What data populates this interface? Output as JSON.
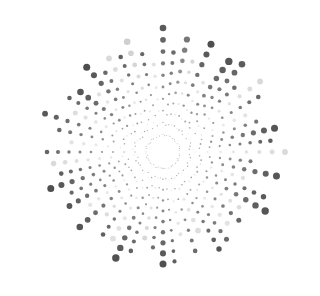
{
  "artwork": {
    "type": "radial-dot-starburst",
    "background": "#ffffff",
    "center": [
      163,
      152
    ],
    "width": 320,
    "height": 296,
    "rays": [
      {
        "angle": -90,
        "length": 124,
        "shade": "#5a5a5a",
        "dots": 10,
        "maxR": 2.8
      },
      {
        "angle": -84,
        "length": 100,
        "shade": "#6a6a6a",
        "dots": 9,
        "maxR": 1.8
      },
      {
        "angle": -78,
        "length": 115,
        "shade": "#777777",
        "dots": 10,
        "maxR": 2.6
      },
      {
        "angle": -72,
        "length": 95,
        "shade": "#d6d6d6",
        "dots": 8,
        "maxR": 1.6
      },
      {
        "angle": -66,
        "length": 118,
        "shade": "#4e4e4e",
        "dots": 10,
        "maxR": 3.0
      },
      {
        "angle": -60,
        "length": 80,
        "shade": "#e2e2e2",
        "dots": 7,
        "maxR": 1.4
      },
      {
        "angle": -54,
        "length": 112,
        "shade": "#555555",
        "dots": 10,
        "maxR": 3.2
      },
      {
        "angle": -48,
        "length": 118,
        "shade": "#5c5c5c",
        "dots": 10,
        "maxR": 2.8
      },
      {
        "angle": -42,
        "length": 96,
        "shade": "#6e6e6e",
        "dots": 9,
        "maxR": 1.8
      },
      {
        "angle": -36,
        "length": 120,
        "shade": "#d8d8d8",
        "dots": 9,
        "maxR": 2.4
      },
      {
        "angle": -30,
        "length": 110,
        "shade": "#676767",
        "dots": 10,
        "maxR": 1.8
      },
      {
        "angle": -24,
        "length": 90,
        "shade": "#e4e4e4",
        "dots": 7,
        "maxR": 1.6
      },
      {
        "angle": -18,
        "length": 98,
        "shade": "#777777",
        "dots": 8,
        "maxR": 1.6
      },
      {
        "angle": -12,
        "length": 114,
        "shade": "#555555",
        "dots": 10,
        "maxR": 3.0
      },
      {
        "angle": -6,
        "length": 108,
        "shade": "#5e5e5e",
        "dots": 10,
        "maxR": 1.8
      },
      {
        "angle": 0,
        "length": 122,
        "shade": "#dadada",
        "dots": 9,
        "maxR": 2.4
      },
      {
        "angle": 6,
        "length": 88,
        "shade": "#7a7a7a",
        "dots": 8,
        "maxR": 1.5
      },
      {
        "angle": 12,
        "length": 116,
        "shade": "#565656",
        "dots": 10,
        "maxR": 3.0
      },
      {
        "angle": 18,
        "length": 84,
        "shade": "#e0e0e0",
        "dots": 7,
        "maxR": 1.6
      },
      {
        "angle": 24,
        "length": 110,
        "shade": "#5a5a5a",
        "dots": 10,
        "maxR": 2.2
      },
      {
        "angle": 30,
        "length": 118,
        "shade": "#555555",
        "dots": 10,
        "maxR": 3.2
      },
      {
        "angle": 36,
        "length": 94,
        "shade": "#dcdcdc",
        "dots": 8,
        "maxR": 1.8
      },
      {
        "angle": 42,
        "length": 102,
        "shade": "#666666",
        "dots": 9,
        "maxR": 2.0
      },
      {
        "angle": 48,
        "length": 96,
        "shade": "#e2e2e2",
        "dots": 8,
        "maxR": 2.0
      },
      {
        "angle": 54,
        "length": 108,
        "shade": "#6a6a6a",
        "dots": 10,
        "maxR": 2.0
      },
      {
        "angle": 60,
        "length": 112,
        "shade": "#555555",
        "dots": 10,
        "maxR": 2.2
      },
      {
        "angle": 66,
        "length": 86,
        "shade": "#dedede",
        "dots": 7,
        "maxR": 2.4
      },
      {
        "angle": 72,
        "length": 104,
        "shade": "#6c6c6c",
        "dots": 9,
        "maxR": 1.8
      },
      {
        "angle": 78,
        "length": 84,
        "shade": "#e4e4e4",
        "dots": 7,
        "maxR": 1.5
      },
      {
        "angle": 84,
        "length": 110,
        "shade": "#5e5e5e",
        "dots": 10,
        "maxR": 1.6
      },
      {
        "angle": 90,
        "length": 112,
        "shade": "#505050",
        "dots": 10,
        "maxR": 3.0
      },
      {
        "angle": 96,
        "length": 96,
        "shade": "#6e6e6e",
        "dots": 9,
        "maxR": 1.6
      },
      {
        "angle": 102,
        "length": 88,
        "shade": "#d8d8d8",
        "dots": 8,
        "maxR": 2.0
      },
      {
        "angle": 108,
        "length": 104,
        "shade": "#616161",
        "dots": 10,
        "maxR": 1.8
      },
      {
        "angle": 114,
        "length": 116,
        "shade": "#525252",
        "dots": 10,
        "maxR": 3.2
      },
      {
        "angle": 120,
        "length": 100,
        "shade": "#e0e0e0",
        "dots": 8,
        "maxR": 2.4
      },
      {
        "angle": 126,
        "length": 102,
        "shade": "#606060",
        "dots": 10,
        "maxR": 1.8
      },
      {
        "angle": 132,
        "length": 84,
        "shade": "#dcdcdc",
        "dots": 7,
        "maxR": 1.6
      },
      {
        "angle": 138,
        "length": 112,
        "shade": "#555555",
        "dots": 10,
        "maxR": 2.8
      },
      {
        "angle": 144,
        "length": 90,
        "shade": "#e4e4e4",
        "dots": 8,
        "maxR": 1.6
      },
      {
        "angle": 150,
        "length": 108,
        "shade": "#575757",
        "dots": 10,
        "maxR": 2.4
      },
      {
        "angle": 156,
        "length": 100,
        "shade": "#6a6a6a",
        "dots": 9,
        "maxR": 1.6
      },
      {
        "angle": 162,
        "length": 118,
        "shade": "#4f4f4f",
        "dots": 10,
        "maxR": 3.0
      },
      {
        "angle": 168,
        "length": 104,
        "shade": "#5f5f5f",
        "dots": 10,
        "maxR": 1.8
      },
      {
        "angle": 174,
        "length": 110,
        "shade": "#dadada",
        "dots": 9,
        "maxR": 2.2
      },
      {
        "angle": 180,
        "length": 116,
        "shade": "#666666",
        "dots": 10,
        "maxR": 1.8
      },
      {
        "angle": 186,
        "length": 92,
        "shade": "#e2e2e2",
        "dots": 7,
        "maxR": 1.6
      },
      {
        "angle": 192,
        "length": 106,
        "shade": "#6a6a6a",
        "dots": 9,
        "maxR": 1.8
      },
      {
        "angle": 198,
        "length": 124,
        "shade": "#585858",
        "dots": 10,
        "maxR": 2.4
      },
      {
        "angle": 204,
        "length": 96,
        "shade": "#dedede",
        "dots": 8,
        "maxR": 2.0
      },
      {
        "angle": 210,
        "length": 108,
        "shade": "#626262",
        "dots": 10,
        "maxR": 1.8
      },
      {
        "angle": 216,
        "length": 102,
        "shade": "#555555",
        "dots": 10,
        "maxR": 2.8
      },
      {
        "angle": 222,
        "length": 86,
        "shade": "#e0e0e0",
        "dots": 7,
        "maxR": 1.6
      },
      {
        "angle": 228,
        "length": 114,
        "shade": "#4e4e4e",
        "dots": 10,
        "maxR": 3.0
      },
      {
        "angle": 234,
        "length": 98,
        "shade": "#6a6a6a",
        "dots": 9,
        "maxR": 1.8
      },
      {
        "angle": 240,
        "length": 108,
        "shade": "#dadada",
        "dots": 8,
        "maxR": 2.4
      },
      {
        "angle": 246,
        "length": 104,
        "shade": "#606060",
        "dots": 10,
        "maxR": 1.8
      },
      {
        "angle": 252,
        "length": 116,
        "shade": "#cfcfcf",
        "dots": 9,
        "maxR": 2.8
      },
      {
        "angle": 258,
        "length": 100,
        "shade": "#666666",
        "dots": 9,
        "maxR": 1.6
      },
      {
        "angle": 264,
        "length": 88,
        "shade": "#e2e2e2",
        "dots": 7,
        "maxR": 1.6
      }
    ]
  }
}
